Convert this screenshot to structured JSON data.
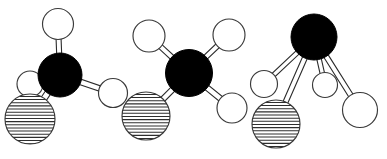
{
  "figure": {
    "width": 387,
    "height": 159,
    "background_color": "#ffffff",
    "atom_styles": {
      "black": {
        "name": "central-atom",
        "fill": "#000000",
        "stroke": "#000000"
      },
      "white": {
        "name": "plain-substituent",
        "fill": "#ffffff",
        "stroke": "#3a3a3a"
      },
      "hatched": {
        "name": "hatched-substituent",
        "fill": "#ffffff",
        "stroke": "#2e2e2e",
        "hatch_color": "#2e2e2e"
      }
    },
    "molecules": [
      {
        "id": "molecule-1",
        "label": "left-molecule",
        "center": {
          "cx": 60,
          "cy": 75,
          "r": 22,
          "style": "black",
          "name": "central-atom"
        },
        "substituents": [
          {
            "name": "top-substituent",
            "cx": 58,
            "cy": 24,
            "r": 15.5,
            "style": "white"
          },
          {
            "name": "left-substituent",
            "cx": 30,
            "cy": 84,
            "r": 13,
            "style": "white"
          },
          {
            "name": "right-substituent",
            "cx": 113,
            "cy": 93,
            "r": 14.5,
            "style": "white"
          },
          {
            "name": "lower-left-hatched-substituent",
            "cx": 30,
            "cy": 119,
            "r": 25,
            "style": "hatched"
          }
        ],
        "bonds": [
          {
            "name": "bond-to-top",
            "from": "center",
            "to": "top-substituent",
            "width": 5
          },
          {
            "name": "bond-to-left",
            "from": "center",
            "to": "left-substituent",
            "width": 5
          },
          {
            "name": "bond-to-right",
            "from": "center",
            "to": "right-substituent",
            "width": 5.5
          },
          {
            "name": "bond-to-hatched",
            "from": "center",
            "to": "lower-left-hatched-substituent",
            "width": 6
          }
        ]
      },
      {
        "id": "molecule-2",
        "label": "middle-molecule",
        "center": {
          "cx": 189,
          "cy": 73,
          "r": 23.5,
          "style": "black",
          "name": "central-atom"
        },
        "substituents": [
          {
            "name": "top-left-substituent",
            "cx": 149,
            "cy": 36,
            "r": 16,
            "style": "white"
          },
          {
            "name": "top-right-substituent",
            "cx": 229,
            "cy": 35,
            "r": 16,
            "style": "white"
          },
          {
            "name": "bottom-right-substituent",
            "cx": 232,
            "cy": 108,
            "r": 15,
            "style": "white"
          },
          {
            "name": "bottom-left-hatched-substituent",
            "cx": 146,
            "cy": 116,
            "r": 24,
            "style": "hatched"
          }
        ],
        "bonds": [
          {
            "name": "bond-to-top-left",
            "from": "center",
            "to": "top-left-substituent",
            "width": 5
          },
          {
            "name": "bond-to-top-right",
            "from": "center",
            "to": "top-right-substituent",
            "width": 5
          },
          {
            "name": "bond-to-bottom-right",
            "from": "center",
            "to": "bottom-right-substituent",
            "width": 5.5
          },
          {
            "name": "bond-to-hatched",
            "from": "center",
            "to": "bottom-left-hatched-substituent",
            "width": 5.5
          }
        ]
      },
      {
        "id": "molecule-3",
        "label": "right-molecule",
        "center": {
          "cx": 314,
          "cy": 37,
          "r": 23,
          "style": "black",
          "name": "central-atom"
        },
        "substituents": [
          {
            "name": "left-substituent",
            "cx": 264,
            "cy": 84,
            "r": 13.5,
            "style": "white"
          },
          {
            "name": "middle-substituent",
            "cx": 325,
            "cy": 85,
            "r": 12.5,
            "style": "white"
          },
          {
            "name": "right-substituent",
            "cx": 360,
            "cy": 110,
            "r": 17.5,
            "style": "white"
          },
          {
            "name": "bottom-left-hatched-substituent",
            "cx": 276,
            "cy": 124,
            "r": 24,
            "style": "hatched"
          }
        ],
        "bonds": [
          {
            "name": "bond-to-left",
            "from": "center",
            "to": "left-substituent",
            "width": 4.5
          },
          {
            "name": "bond-to-middle",
            "from": "center",
            "to": "middle-substituent",
            "width": 4.5
          },
          {
            "name": "bond-to-right",
            "from": "center",
            "to": "right-substituent",
            "width": 5
          },
          {
            "name": "bond-to-hatched",
            "from": "center",
            "to": "bottom-left-hatched-substituent",
            "width": 5
          }
        ]
      }
    ]
  }
}
